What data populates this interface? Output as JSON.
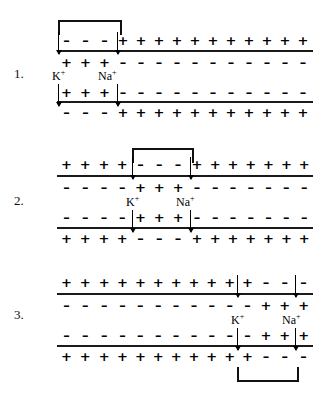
{
  "figure": {
    "ink_color": "#000000"
  },
  "glyphs": {
    "plus": "+",
    "minus": "–",
    "potassium": "K",
    "sodium": "Na",
    "charge_superscript": "+"
  },
  "panels": [
    {
      "number": "1.",
      "depolarized_zone": "left",
      "bracket_position": "top",
      "bracket": {
        "left": 58,
        "right": 118
      },
      "labels": {
        "potassium": "K",
        "potassium_charge": "+",
        "sodium": "Na",
        "sodium_charge": "+"
      },
      "rows": {
        "outer_top": {
          "left_signs": "minus",
          "left_count": 3,
          "right_signs": "plus",
          "right_count": 11
        },
        "inner_top": {
          "left_signs": "plus",
          "left_count": 3,
          "right_signs": "minus",
          "right_count": 11
        },
        "inner_bottom": {
          "left_signs": "plus",
          "left_count": 3,
          "right_signs": "minus",
          "right_count": 11
        },
        "outer_bottom": {
          "left_signs": "minus",
          "left_count": 3,
          "right_signs": "plus",
          "right_count": 11
        }
      }
    },
    {
      "number": "2.",
      "depolarized_zone": "middle",
      "bracket_position": "top",
      "bracket": {
        "left": 132,
        "right": 190
      },
      "labels": {
        "potassium": "K",
        "potassium_charge": "+",
        "sodium": "Na",
        "sodium_charge": "+"
      },
      "rows": {
        "outer_top": {
          "before_count": 4,
          "before_signs": "plus",
          "zone_signs": "minus",
          "zone_count": 3,
          "after_signs": "plus",
          "after_count": 7
        },
        "inner_top": {
          "before_count": 4,
          "before_signs": "minus",
          "zone_signs": "plus",
          "zone_count": 3,
          "after_signs": "minus",
          "after_count": 7
        },
        "inner_bottom": {
          "before_count": 4,
          "before_signs": "minus",
          "zone_signs": "plus",
          "zone_count": 3,
          "after_signs": "minus",
          "after_count": 7
        },
        "outer_bottom": {
          "before_count": 4,
          "before_signs": "plus",
          "zone_signs": "minus",
          "zone_count": 3,
          "after_signs": "plus",
          "after_count": 7
        }
      }
    },
    {
      "number": "3.",
      "depolarized_zone": "right",
      "bracket_position": "bottom",
      "bracket": {
        "left": 237,
        "right": 295
      },
      "labels": {
        "potassium": "K",
        "potassium_charge": "+",
        "sodium": "Na",
        "sodium_charge": "+"
      },
      "rows": {
        "outer_top": {
          "left_signs": "plus",
          "left_count": 11,
          "right_signs": "minus",
          "right_count": 3
        },
        "inner_top": {
          "left_signs": "minus",
          "left_count": 11,
          "right_signs": "plus",
          "right_count": 3
        },
        "inner_bottom": {
          "left_signs": "minus",
          "left_count": 11,
          "right_signs": "plus",
          "right_count": 3
        },
        "outer_bottom": {
          "left_signs": "plus",
          "left_count": 11,
          "right_signs": "minus",
          "right_count": 3
        }
      }
    }
  ]
}
